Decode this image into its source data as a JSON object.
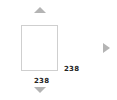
{
  "preview": {
    "width_label": "238",
    "height_label": "238"
  },
  "controls": {
    "up_icon": "triangle-up",
    "down_icon": "triangle-down",
    "right_icon": "triangle-right"
  },
  "colors": {
    "arrow": "#b4b4b4",
    "box_border": "#cfcfcf",
    "label": "#222222"
  }
}
